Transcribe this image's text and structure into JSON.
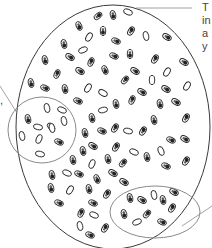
{
  "diagram": {
    "colors": {
      "background": "#ffffff",
      "outline": "#3a3a3a",
      "subgroup_outline": "#8a8a8a",
      "organism_fill": "#ffffff",
      "organism_mark": "#222222",
      "text": "#444444"
    },
    "labels": {
      "right_top": [
        "T",
        "in",
        "a",
        "y"
      ],
      "left": [
        ",",
        ","
      ]
    },
    "population_boundary": {
      "cx": 113,
      "cy": 127,
      "rx": 97,
      "ry": 122
    },
    "subgroups": [
      {
        "name": "left-subgroup",
        "cx": 42,
        "cy": 130,
        "rx": 34,
        "ry": 33
      },
      {
        "name": "bottom-right-subgroup",
        "cx": 155,
        "cy": 212,
        "rx": 45,
        "ry": 26
      }
    ],
    "leaders": [
      {
        "name": "top-right-leader",
        "x1": 136,
        "y1": 8,
        "x2": 192,
        "y2": 8
      },
      {
        "name": "left-leader",
        "x1": 0,
        "y1": 86,
        "x2": 17,
        "y2": 113
      },
      {
        "name": "bottom-right-leader",
        "x1": 182,
        "y1": 226,
        "x2": 212,
        "y2": 206
      }
    ],
    "organisms": [
      {
        "x": 98,
        "y": 16,
        "r": -40,
        "t": "d"
      },
      {
        "x": 113,
        "y": 15,
        "r": 80,
        "t": "d"
      },
      {
        "x": 128,
        "y": 12,
        "r": 20,
        "t": "c"
      },
      {
        "x": 79,
        "y": 26,
        "r": 70,
        "t": "d"
      },
      {
        "x": 103,
        "y": 31,
        "r": 90,
        "t": "d"
      },
      {
        "x": 131,
        "y": 31,
        "r": -60,
        "t": "d"
      },
      {
        "x": 146,
        "y": 36,
        "r": 80,
        "t": "c"
      },
      {
        "x": 167,
        "y": 37,
        "r": 30,
        "t": "d"
      },
      {
        "x": 89,
        "y": 37,
        "r": -60,
        "t": "c"
      },
      {
        "x": 116,
        "y": 41,
        "r": 20,
        "t": "d"
      },
      {
        "x": 64,
        "y": 44,
        "r": 80,
        "t": "d"
      },
      {
        "x": 83,
        "y": 50,
        "r": -20,
        "t": "c"
      },
      {
        "x": 70,
        "y": 57,
        "r": 30,
        "t": "d"
      },
      {
        "x": 114,
        "y": 56,
        "r": 20,
        "t": "d"
      },
      {
        "x": 130,
        "y": 54,
        "r": 90,
        "t": "d"
      },
      {
        "x": 155,
        "y": 59,
        "r": -60,
        "t": "d"
      },
      {
        "x": 184,
        "y": 62,
        "r": 30,
        "t": "d"
      },
      {
        "x": 45,
        "y": 60,
        "r": 80,
        "t": "d"
      },
      {
        "x": 91,
        "y": 62,
        "r": -70,
        "t": "d"
      },
      {
        "x": 80,
        "y": 71,
        "r": 30,
        "t": "d"
      },
      {
        "x": 105,
        "y": 70,
        "r": 70,
        "t": "d"
      },
      {
        "x": 135,
        "y": 71,
        "r": 30,
        "t": "d"
      },
      {
        "x": 167,
        "y": 72,
        "r": -60,
        "t": "c"
      },
      {
        "x": 57,
        "y": 74,
        "r": -70,
        "t": "d"
      },
      {
        "x": 125,
        "y": 80,
        "r": -50,
        "t": "d"
      },
      {
        "x": 152,
        "y": 80,
        "r": 90,
        "t": "c"
      },
      {
        "x": 187,
        "y": 86,
        "r": -60,
        "t": "c"
      },
      {
        "x": 31,
        "y": 83,
        "r": 80,
        "t": "d"
      },
      {
        "x": 45,
        "y": 88,
        "r": 20,
        "t": "d"
      },
      {
        "x": 65,
        "y": 89,
        "r": 80,
        "t": "d"
      },
      {
        "x": 88,
        "y": 88,
        "r": -60,
        "t": "c"
      },
      {
        "x": 103,
        "y": 93,
        "r": 30,
        "t": "c"
      },
      {
        "x": 142,
        "y": 92,
        "r": 30,
        "t": "d"
      },
      {
        "x": 166,
        "y": 89,
        "r": 30,
        "t": "d"
      },
      {
        "x": 78,
        "y": 101,
        "r": 20,
        "t": "d"
      },
      {
        "x": 116,
        "y": 104,
        "r": 80,
        "t": "d"
      },
      {
        "x": 132,
        "y": 100,
        "r": -70,
        "t": "d"
      },
      {
        "x": 160,
        "y": 104,
        "r": 80,
        "t": "d"
      },
      {
        "x": 176,
        "y": 102,
        "r": 30,
        "t": "d"
      },
      {
        "x": 103,
        "y": 110,
        "r": -10,
        "t": "c"
      },
      {
        "x": 92,
        "y": 118,
        "r": 80,
        "t": "d"
      },
      {
        "x": 154,
        "y": 120,
        "r": 80,
        "t": "d"
      },
      {
        "x": 186,
        "y": 118,
        "r": -60,
        "t": "d"
      },
      {
        "x": 47,
        "y": 108,
        "r": 80,
        "t": "c"
      },
      {
        "x": 62,
        "y": 110,
        "r": 20,
        "t": "c"
      },
      {
        "x": 28,
        "y": 119,
        "r": 80,
        "t": "d"
      },
      {
        "x": 38,
        "y": 127,
        "r": 10,
        "t": "c"
      },
      {
        "x": 51,
        "y": 127,
        "r": 50,
        "t": "d"
      },
      {
        "x": 64,
        "y": 121,
        "r": 80,
        "t": "c"
      },
      {
        "x": 22,
        "y": 136,
        "r": 80,
        "t": "c"
      },
      {
        "x": 39,
        "y": 139,
        "r": -70,
        "t": "c"
      },
      {
        "x": 52,
        "y": 128,
        "r": 80,
        "t": "c"
      },
      {
        "x": 59,
        "y": 142,
        "r": 20,
        "t": "d"
      },
      {
        "x": 40,
        "y": 154,
        "r": 10,
        "t": "c"
      },
      {
        "x": 85,
        "y": 133,
        "r": 80,
        "t": "d"
      },
      {
        "x": 102,
        "y": 131,
        "r": 20,
        "t": "d"
      },
      {
        "x": 115,
        "y": 128,
        "r": -60,
        "t": "d"
      },
      {
        "x": 128,
        "y": 131,
        "r": 10,
        "t": "c"
      },
      {
        "x": 143,
        "y": 131,
        "r": -60,
        "t": "d"
      },
      {
        "x": 171,
        "y": 140,
        "r": 20,
        "t": "d"
      },
      {
        "x": 185,
        "y": 139,
        "r": 30,
        "t": "d"
      },
      {
        "x": 93,
        "y": 146,
        "r": 30,
        "t": "d"
      },
      {
        "x": 83,
        "y": 151,
        "r": 80,
        "t": "d"
      },
      {
        "x": 116,
        "y": 147,
        "r": -60,
        "t": "d"
      },
      {
        "x": 134,
        "y": 152,
        "r": 20,
        "t": "c"
      },
      {
        "x": 147,
        "y": 157,
        "r": 80,
        "t": "d"
      },
      {
        "x": 161,
        "y": 151,
        "r": 70,
        "t": "c"
      },
      {
        "x": 186,
        "y": 161,
        "r": -60,
        "t": "d"
      },
      {
        "x": 73,
        "y": 160,
        "r": 80,
        "t": "d"
      },
      {
        "x": 92,
        "y": 164,
        "r": -70,
        "t": "c"
      },
      {
        "x": 108,
        "y": 159,
        "r": 80,
        "t": "d"
      },
      {
        "x": 123,
        "y": 163,
        "r": -50,
        "t": "d"
      },
      {
        "x": 166,
        "y": 166,
        "r": 20,
        "t": "d"
      },
      {
        "x": 52,
        "y": 175,
        "r": 80,
        "t": "d"
      },
      {
        "x": 67,
        "y": 173,
        "r": 20,
        "t": "c"
      },
      {
        "x": 79,
        "y": 174,
        "r": 20,
        "t": "d"
      },
      {
        "x": 97,
        "y": 179,
        "r": 70,
        "t": "d"
      },
      {
        "x": 113,
        "y": 173,
        "r": 30,
        "t": "d"
      },
      {
        "x": 124,
        "y": 182,
        "r": 30,
        "t": "d"
      },
      {
        "x": 51,
        "y": 188,
        "r": 80,
        "t": "d"
      },
      {
        "x": 70,
        "y": 190,
        "r": -60,
        "t": "c"
      },
      {
        "x": 89,
        "y": 189,
        "r": 80,
        "t": "d"
      },
      {
        "x": 107,
        "y": 194,
        "r": -60,
        "t": "d"
      },
      {
        "x": 130,
        "y": 198,
        "r": 80,
        "t": "d"
      },
      {
        "x": 142,
        "y": 200,
        "r": 30,
        "t": "d"
      },
      {
        "x": 154,
        "y": 195,
        "r": 80,
        "t": "c"
      },
      {
        "x": 163,
        "y": 200,
        "r": 80,
        "t": "d"
      },
      {
        "x": 174,
        "y": 192,
        "r": 30,
        "t": "d"
      },
      {
        "x": 59,
        "y": 203,
        "r": 20,
        "t": "d"
      },
      {
        "x": 93,
        "y": 203,
        "r": 20,
        "t": "d"
      },
      {
        "x": 172,
        "y": 208,
        "r": -60,
        "t": "d"
      },
      {
        "x": 124,
        "y": 214,
        "r": 80,
        "t": "d"
      },
      {
        "x": 147,
        "y": 214,
        "r": -50,
        "t": "d"
      },
      {
        "x": 81,
        "y": 213,
        "r": -70,
        "t": "d"
      },
      {
        "x": 94,
        "y": 215,
        "r": 20,
        "t": "c"
      },
      {
        "x": 80,
        "y": 226,
        "r": 80,
        "t": "c"
      },
      {
        "x": 105,
        "y": 228,
        "r": -60,
        "t": "d"
      },
      {
        "x": 137,
        "y": 222,
        "r": -20,
        "t": "c"
      },
      {
        "x": 162,
        "y": 222,
        "r": 20,
        "t": "d"
      },
      {
        "x": 90,
        "y": 235,
        "r": 20,
        "t": "d"
      }
    ]
  }
}
